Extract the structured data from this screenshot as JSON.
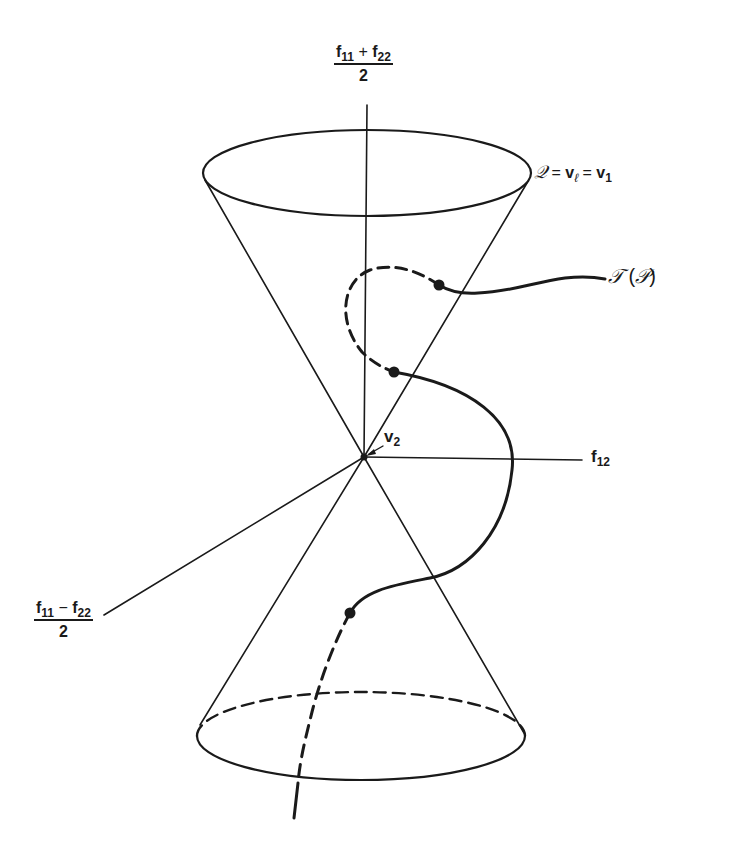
{
  "figure": {
    "colors": {
      "ink": "#1a1a1a",
      "background": "#ffffff"
    }
  },
  "axes": {
    "vertical": {
      "numerator_a": "f",
      "sub_a": "11",
      "operator": "+",
      "numerator_b": "f",
      "sub_b": "22",
      "denominator": "2"
    },
    "horizontal": {
      "symbol": "f",
      "sub": "12"
    },
    "diagonal": {
      "numerator_a": "f",
      "sub_a": "11",
      "operator": "−",
      "numerator_b": "f",
      "sub_b": "22",
      "denominator": "2"
    }
  },
  "labels": {
    "cone": {
      "script_q": "𝒬",
      "eq1": " = ",
      "v_l": "v",
      "v_l_sub": "ℓ",
      "eq2": " = ",
      "v_1": "v",
      "v_1_sub": "1"
    },
    "vertex": {
      "symbol": "v",
      "sub": "2"
    },
    "trajectory": {
      "script_t": "𝒯",
      "open": " (",
      "script_p": "𝒫",
      "close": ")"
    }
  },
  "geometry": {
    "apex": [
      364,
      457
    ],
    "top_ellipse": {
      "cx": 367,
      "cy": 173,
      "rx": 164,
      "ry": 43
    },
    "bottom_ellipse": {
      "cx": 361,
      "cy": 736,
      "rx": 164,
      "ry": 44
    },
    "marked_points": [
      [
        439,
        285
      ],
      [
        394,
        372
      ],
      [
        350,
        613
      ]
    ]
  }
}
